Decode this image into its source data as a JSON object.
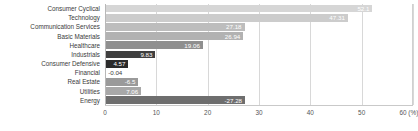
{
  "chart_data": {
    "type": "bar",
    "orientation": "horizontal",
    "title": "",
    "xlabel": "(%)",
    "ylabel": "",
    "xlim": [
      0,
      60
    ],
    "xticks": [
      0,
      10,
      20,
      30,
      40,
      50,
      60
    ],
    "xtick_labels": [
      "0",
      "10",
      "20",
      "30",
      "40",
      "50",
      "60 (%)"
    ],
    "grid": true,
    "legend": "none",
    "note": "Bars are drawn by magnitude; data labels show signed values.",
    "categories": [
      "Consumer Cyclical",
      "Technology",
      "Communication Services",
      "Basic Materials",
      "Healthcare",
      "Industrials",
      "Consumer Defensive",
      "Financial",
      "Real Estate",
      "Utilities",
      "Energy"
    ],
    "values": [
      52.1,
      47.31,
      27.18,
      26.94,
      19.06,
      9.83,
      4.57,
      -0.04,
      -6.5,
      7.06,
      -27.28
    ],
    "magnitudes": [
      52.1,
      47.31,
      27.18,
      26.94,
      19.06,
      9.83,
      4.57,
      0.04,
      6.5,
      7.06,
      27.28
    ],
    "value_labels": [
      "52.1",
      "47.31",
      "27.18",
      "26.94",
      "19.06",
      "9.83",
      "4.57",
      "-0.04",
      "-6.5",
      "7.06",
      "-27.28"
    ],
    "label_inside": [
      true,
      true,
      true,
      true,
      true,
      true,
      true,
      false,
      true,
      true,
      true
    ],
    "bar_colors": [
      "#d6d6d6",
      "#cccccc",
      "#bdbdbd",
      "#b2b2b2",
      "#8f8f8f",
      "#3f3f3f",
      "#2b2b2b",
      "#2b2b2b",
      "#9a9a9a",
      "#a8a8a8",
      "#6e6e6e"
    ],
    "colors": {
      "grid": "#d8d8d8",
      "axis": "#b8b8b8",
      "label_text": "#3a3a3a",
      "tick_text": "#555555",
      "background": "#ffffff"
    }
  }
}
